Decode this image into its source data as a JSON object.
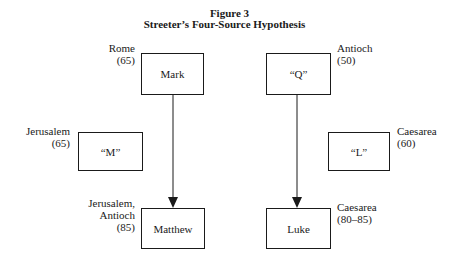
{
  "figure": {
    "number": "Figure 3",
    "title": "Streeter’s Four-Source Hypothesis"
  },
  "nodes": [
    {
      "id": "mark",
      "label": "Mark",
      "place": "Rome",
      "date": "(65)"
    },
    {
      "id": "q",
      "label": "“Q”",
      "place": "Antioch",
      "date": "(50)"
    },
    {
      "id": "m",
      "label": "“M”",
      "place": "Jerusalem",
      "date": "(65)"
    },
    {
      "id": "l",
      "label": "“L”",
      "place": "Caesarea",
      "date": "(60)"
    },
    {
      "id": "matthew",
      "label": "Matthew",
      "place": "Jerusalem,",
      "place2": "Antioch",
      "date": "(85)"
    },
    {
      "id": "luke",
      "label": "Luke",
      "place": "Caesarea",
      "date": "(80–85)"
    }
  ],
  "edges": [
    {
      "from": "mark",
      "to": "matthew"
    },
    {
      "from": "q",
      "to": "luke"
    }
  ]
}
